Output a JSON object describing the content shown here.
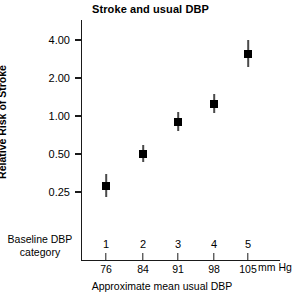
{
  "chart_data": {
    "type": "scatter",
    "title": "Stroke and usual DBP",
    "xlabel": "Approximate mean usual DBP",
    "ylabel": "Relative Risk of Stroke",
    "yscale": "log",
    "ylim": [
      0.2,
      5.0
    ],
    "grid": false,
    "legend": null,
    "x_unit": "mm Hg",
    "category_row_label": "Baseline DBP category",
    "categories": [
      "1",
      "2",
      "3",
      "4",
      "5"
    ],
    "x": [
      76,
      84,
      91,
      98,
      105
    ],
    "x_tick_labels": [
      "76",
      "84",
      "91",
      "98",
      "105"
    ],
    "y_tick_labels": [
      "4.00",
      "2.00",
      "1.00",
      "0.50",
      "0.25"
    ],
    "y_ticks": [
      4.0,
      2.0,
      1.0,
      0.5,
      0.25
    ],
    "values": [
      0.28,
      0.5,
      0.9,
      1.25,
      3.1
    ],
    "error_low": [
      0.23,
      0.43,
      0.76,
      1.05,
      2.45
    ],
    "error_high": [
      0.35,
      0.59,
      1.08,
      1.5,
      4.0
    ],
    "points": [
      {
        "category": "1",
        "x_label": "76",
        "y": 0.28,
        "lo": 0.23,
        "hi": 0.35
      },
      {
        "category": "2",
        "x_label": "84",
        "y": 0.5,
        "lo": 0.43,
        "hi": 0.59
      },
      {
        "category": "3",
        "x_label": "91",
        "y": 0.9,
        "lo": 0.76,
        "hi": 1.08
      },
      {
        "category": "4",
        "x_label": "98",
        "y": 1.25,
        "lo": 1.05,
        "hi": 1.5
      },
      {
        "category": "5",
        "x_label": "105",
        "y": 3.1,
        "lo": 2.45,
        "hi": 4.0
      }
    ],
    "colors": {
      "marker": "#000000",
      "errorbar": "#4a4a4a",
      "axis": "#1a1a1a",
      "background": "#ffffff",
      "text": "#000000"
    }
  }
}
